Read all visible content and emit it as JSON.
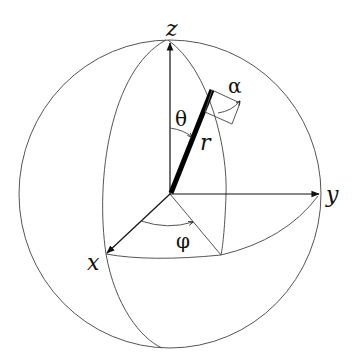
{
  "diagram": {
    "labels": {
      "z_axis": "z",
      "y_axis": "y",
      "x_axis": "x",
      "radius": "r",
      "polar_angle": "θ",
      "azimuth_angle": "φ",
      "rotation_angle": "α"
    },
    "colors": {
      "stroke": "#111111",
      "sphere_outline": "#555555",
      "background": "#ffffff"
    }
  }
}
